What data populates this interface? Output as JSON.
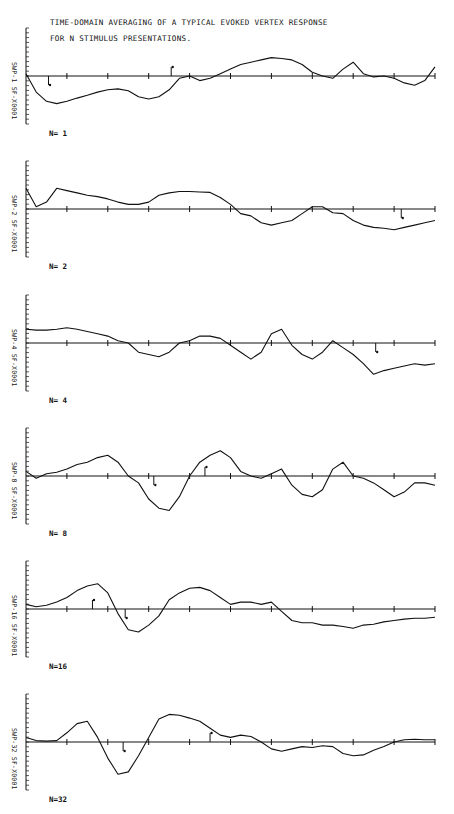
{
  "chart_data": {
    "type": "line",
    "title": "TIME-DOMAIN AVERAGING OF A TYPICAL EVOKED VERTEX RESPONSE",
    "subtitle": "FOR N STIMULUS PRESENTATIONS.",
    "xlabel": "",
    "ylabel": "",
    "grid": false,
    "legend": "none",
    "x_ticks": 11,
    "x": [
      0,
      1,
      2,
      3,
      4,
      5,
      6,
      7,
      8,
      9,
      10,
      11,
      12,
      13,
      14,
      15,
      16,
      17,
      18,
      19,
      20,
      21,
      22,
      23,
      24,
      25,
      26,
      27,
      28,
      29,
      30,
      31,
      32,
      33,
      34,
      35,
      36,
      37,
      38,
      39,
      40
    ],
    "ylim": [
      -1,
      1
    ],
    "panels": [
      {
        "label": "N= 1",
        "axis_label": "SF-X0001 SWP-1",
        "values": [
          0.05,
          -0.35,
          -0.55,
          -0.6,
          -0.55,
          -0.48,
          -0.42,
          -0.35,
          -0.3,
          -0.28,
          -0.32,
          -0.45,
          -0.5,
          -0.45,
          -0.3,
          -0.05,
          0.0,
          -0.1,
          -0.05,
          0.05,
          0.15,
          0.25,
          0.3,
          0.35,
          0.4,
          0.38,
          0.35,
          0.25,
          0.08,
          0.0,
          -0.05,
          0.15,
          0.3,
          0.05,
          -0.02,
          0.0,
          -0.05,
          -0.15,
          -0.2,
          -0.1,
          0.2
        ],
        "markers": [
          {
            "x": 2.2,
            "dir": "down"
          },
          {
            "x": 14.2,
            "dir": "up"
          }
        ]
      },
      {
        "label": "N= 2",
        "axis_label": "SF-X0001 SWP-2",
        "values": [
          0.45,
          0.05,
          0.15,
          0.45,
          0.4,
          0.35,
          0.3,
          0.27,
          0.22,
          0.15,
          0.1,
          0.1,
          0.15,
          0.3,
          0.35,
          0.38,
          0.38,
          0.37,
          0.36,
          0.25,
          0.1,
          -0.1,
          -0.15,
          -0.3,
          -0.35,
          -0.3,
          -0.25,
          -0.1,
          0.05,
          0.05,
          -0.08,
          -0.1,
          -0.25,
          -0.35,
          -0.4,
          -0.42,
          -0.45,
          -0.4,
          -0.35,
          -0.3,
          -0.25
        ],
        "markers": [
          {
            "x": 36.7,
            "dir": "down"
          }
        ]
      },
      {
        "label": "N= 4",
        "axis_label": "SF-X0001 SWP-4",
        "values": [
          0.3,
          0.28,
          0.28,
          0.3,
          0.33,
          0.3,
          0.25,
          0.2,
          0.15,
          0.05,
          0.0,
          -0.2,
          -0.25,
          -0.3,
          -0.2,
          0.0,
          0.05,
          0.15,
          0.15,
          0.1,
          -0.05,
          -0.2,
          -0.35,
          -0.2,
          0.2,
          0.3,
          -0.05,
          -0.25,
          -0.35,
          -0.2,
          0.05,
          -0.1,
          -0.25,
          -0.45,
          -0.68,
          -0.6,
          -0.55,
          -0.5,
          -0.45,
          -0.48,
          -0.45
        ],
        "markers": [
          {
            "x": 34.2,
            "dir": "down"
          }
        ]
      },
      {
        "label": "N= 8",
        "axis_label": "SF-X0001 SWP-8",
        "values": [
          0.1,
          -0.05,
          0.05,
          0.08,
          0.15,
          0.25,
          0.3,
          0.4,
          0.45,
          0.3,
          0.0,
          -0.15,
          -0.5,
          -0.7,
          -0.75,
          -0.45,
          0.0,
          0.3,
          0.45,
          0.55,
          0.4,
          0.1,
          0.0,
          -0.05,
          0.05,
          0.15,
          -0.2,
          -0.4,
          -0.45,
          -0.3,
          0.15,
          0.3,
          0.0,
          -0.05,
          -0.15,
          -0.3,
          -0.45,
          -0.35,
          -0.15,
          -0.15,
          -0.2
        ],
        "markers": [
          {
            "x": 12.5,
            "dir": "down"
          },
          {
            "x": 17.5,
            "dir": "up"
          }
        ]
      },
      {
        "label": "N=16",
        "axis_label": "SF-X0001 SWP-16",
        "values": [
          0.1,
          0.05,
          0.08,
          0.15,
          0.25,
          0.4,
          0.5,
          0.55,
          0.35,
          -0.1,
          -0.45,
          -0.5,
          -0.35,
          -0.15,
          0.2,
          0.35,
          0.45,
          0.47,
          0.4,
          0.25,
          0.1,
          0.15,
          0.15,
          0.1,
          0.15,
          -0.05,
          -0.25,
          -0.3,
          -0.3,
          -0.35,
          -0.35,
          -0.38,
          -0.42,
          -0.35,
          -0.33,
          -0.28,
          -0.25,
          -0.22,
          -0.2,
          -0.2,
          -0.18
        ],
        "markers": [
          {
            "x": 6.5,
            "dir": "up"
          },
          {
            "x": 9.7,
            "dir": "down"
          }
        ]
      },
      {
        "label": "N=32",
        "axis_label": "SF-X0001 SWP-32",
        "values": [
          0.1,
          0.03,
          0.02,
          0.03,
          0.2,
          0.4,
          0.45,
          0.1,
          -0.35,
          -0.7,
          -0.65,
          -0.3,
          0.1,
          0.5,
          0.6,
          0.58,
          0.52,
          0.45,
          0.3,
          0.15,
          0.1,
          0.15,
          0.12,
          0.0,
          -0.15,
          -0.2,
          -0.15,
          -0.1,
          -0.12,
          -0.08,
          -0.1,
          -0.25,
          -0.3,
          -0.28,
          -0.18,
          -0.1,
          0.0,
          0.05,
          0.06,
          0.05,
          0.05
        ],
        "markers": [
          {
            "x": 9.5,
            "dir": "down"
          },
          {
            "x": 18.0,
            "dir": "up"
          }
        ]
      }
    ]
  },
  "header": {
    "line1": "TIME-DOMAIN AVERAGING OF A TYPICAL EVOKED VERTEX RESPONSE",
    "line2": "FOR N STIMULUS PRESENTATIONS."
  },
  "colors": {
    "trace": "#111111",
    "background": "#ffffff"
  }
}
